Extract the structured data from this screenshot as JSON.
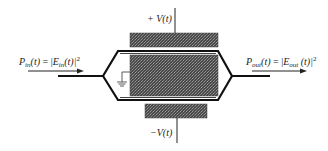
{
  "diagram": {
    "type": "Mach-Zehnder electro-optic modulator schematic",
    "input": {
      "power_symbol": "P",
      "power_sub": "in",
      "field_symbol": "E",
      "field_sub": "in",
      "arg": "(t)",
      "equals": " = |",
      "close": "(t)|",
      "exponent": "2"
    },
    "output": {
      "power_symbol": "P",
      "power_sub": "out",
      "field_symbol": "E",
      "field_sub": "out",
      "arg": "(t)",
      "equals": " = |",
      "close": " (t)|",
      "exponent": "2"
    },
    "top_voltage": {
      "label": "+ V(t)"
    },
    "bottom_voltage": {
      "label": "−V(t)"
    },
    "components": [
      "top-electrode",
      "center-electrode (grounded)",
      "bottom-electrode",
      "upper-waveguide-arm",
      "lower-waveguide-arm",
      "y-splitter",
      "y-combiner",
      "ground-symbol"
    ],
    "colors": {
      "electrode_fill": "#555555",
      "electrode_pattern": "#888888",
      "line": "#111111",
      "background": "#ffffff"
    }
  }
}
